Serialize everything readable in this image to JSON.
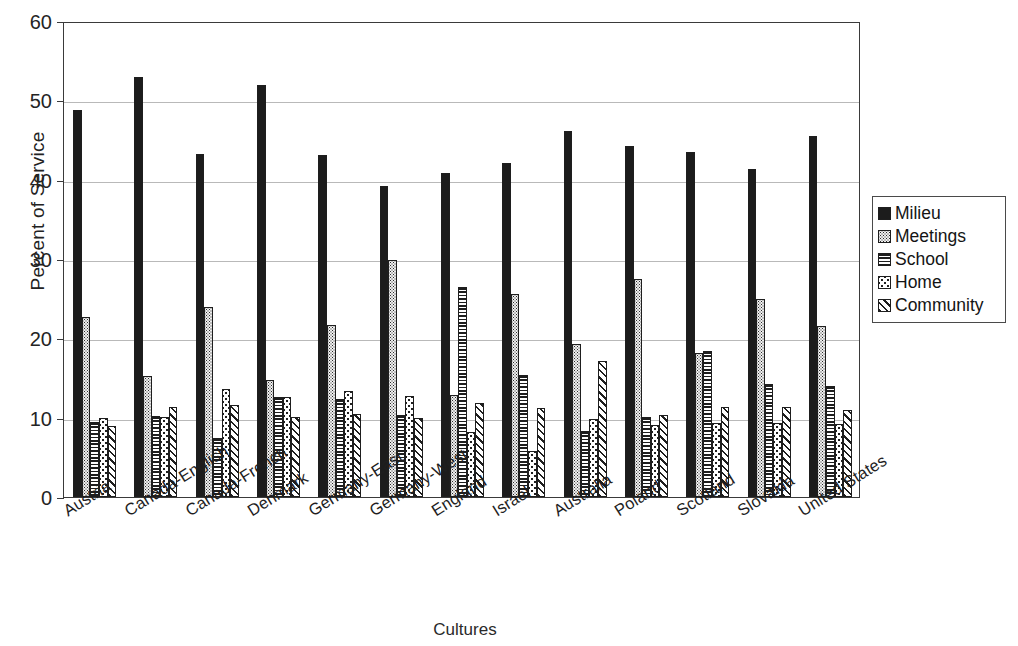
{
  "chart_data": {
    "type": "bar",
    "title": "",
    "xlabel": "Cultures",
    "ylabel": "Percent of Service",
    "ylim": [
      0,
      60
    ],
    "yticks": [
      0,
      10,
      20,
      30,
      40,
      50,
      60
    ],
    "grid": true,
    "legend_position": "right",
    "categories": [
      "Austria",
      "Canada-English",
      "Canada-French",
      "Denmark",
      "Germany-East",
      "Germany-West",
      "England",
      "Israel",
      "Australia",
      "Poland",
      "Scotland",
      "Slovakia",
      "United States"
    ],
    "series": [
      {
        "name": "Milieu",
        "pattern": "solid-black",
        "values": [
          48.8,
          52.9,
          43.2,
          51.9,
          43.1,
          39.2,
          40.9,
          42.1,
          46.1,
          44.3,
          43.5,
          41.4,
          45.5
        ]
      },
      {
        "name": "Meetings",
        "pattern": "fine-dots",
        "values": [
          22.7,
          15.2,
          23.9,
          14.8,
          21.7,
          29.9,
          12.8,
          25.6,
          19.3,
          27.5,
          18.2,
          25.0,
          21.5
        ]
      },
      {
        "name": "School",
        "pattern": "horizontal-lines",
        "values": [
          9.5,
          10.2,
          7.5,
          12.6,
          12.4,
          10.4,
          26.5,
          15.4,
          8.3,
          10.1,
          18.4,
          14.2,
          14.0
        ]
      },
      {
        "name": "Home",
        "pattern": "coarse-dots",
        "values": [
          9.9,
          10.1,
          13.6,
          12.6,
          13.4,
          12.7,
          8.2,
          5.8,
          9.8,
          9.1,
          9.3,
          9.3,
          9.2
        ]
      },
      {
        "name": "Community",
        "pattern": "diagonal-hatch",
        "values": [
          9.0,
          11.3,
          11.6,
          10.1,
          10.5,
          10.0,
          11.8,
          11.2,
          17.1,
          10.3,
          11.4,
          11.3,
          11.0
        ]
      }
    ]
  },
  "legend": {
    "items": [
      {
        "label": "Milieu"
      },
      {
        "label": "Meetings"
      },
      {
        "label": "School"
      },
      {
        "label": "Home"
      },
      {
        "label": "Community"
      }
    ]
  }
}
